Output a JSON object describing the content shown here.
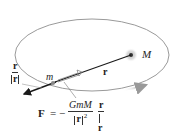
{
  "diagram": {
    "labels": {
      "large_mass": "M",
      "small_mass": "m",
      "position_vector": "r",
      "unit_vector_num": "r",
      "unit_vector_den": "r",
      "force_symbol": "F",
      "equals": "=",
      "minus": "−",
      "force_num": "GmM",
      "force_den_r": "r",
      "force_den_exp": "2",
      "force_unit_num": "r",
      "force_unit_den": "r"
    },
    "colors": {
      "orbit": "#9a9a9a",
      "vector": "#1a1a1a",
      "mass_glow": "#d0d0d0",
      "text": "#222222"
    },
    "geometry": {
      "orbit_center": [
        92,
        55
      ],
      "orbit_rx": 77,
      "orbit_ry": 36,
      "large_mass_pos": [
        131,
        55
      ],
      "small_mass_pos": [
        53,
        83
      ],
      "force_arrow_tip": [
        23,
        94
      ]
    }
  }
}
